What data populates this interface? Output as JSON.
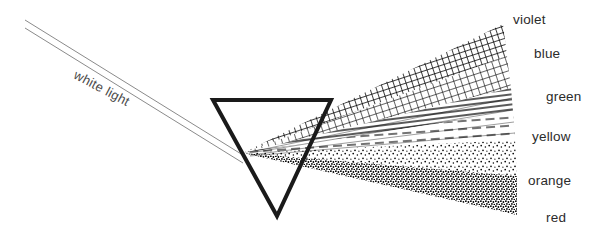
{
  "figure": {
    "background_color": "#ffffff",
    "ink_color": "#000000",
    "width": 614,
    "height": 250
  },
  "incident_beam": {
    "label": "white light",
    "label_rotation_deg": 28,
    "label_x": 78,
    "label_y": 68,
    "ray_count": 2,
    "color": "#777777",
    "start_x": 25,
    "start_y": 20,
    "end_x": 246,
    "end_y": 157
  },
  "prism": {
    "name": "triangular glass prism",
    "orientation": "inverted",
    "stroke_color": "#1a1a1a",
    "stroke_width": 4,
    "vertices": [
      {
        "x": 213,
        "y": 100
      },
      {
        "x": 331,
        "y": 100
      },
      {
        "x": 277,
        "y": 216
      }
    ]
  },
  "spectrum": {
    "name": "refracted spectrum fan",
    "apex_x": 243,
    "apex_y": 153,
    "bands": [
      {
        "label": "violet",
        "texture": "cross-hatch",
        "density": "dense",
        "label_x": 513,
        "label_y": 13,
        "angle_start": -26.5,
        "angle_end": -20.0
      },
      {
        "label": "blue",
        "texture": "cross-hatch",
        "density": "dense",
        "label_x": 534,
        "label_y": 47,
        "angle_start": -20.0,
        "angle_end": -13.0
      },
      {
        "label": "green",
        "texture": "hatch-lines",
        "density": "medium",
        "label_x": 546,
        "label_y": 90,
        "angle_start": -13.0,
        "angle_end": -7.0
      },
      {
        "label": "yellow",
        "texture": "hatch-lines",
        "density": "light",
        "label_x": 532,
        "label_y": 130,
        "angle_start": -7.0,
        "angle_end": -1.0
      },
      {
        "label": "orange",
        "texture": "stipple",
        "density": "medium",
        "label_x": 528,
        "label_y": 174,
        "angle_start": -1.0,
        "angle_end": 5.5
      },
      {
        "label": "red",
        "texture": "stipple",
        "density": "dense",
        "label_x": 546,
        "label_y": 211,
        "angle_start": 5.5,
        "angle_end": 12.0
      }
    ]
  }
}
